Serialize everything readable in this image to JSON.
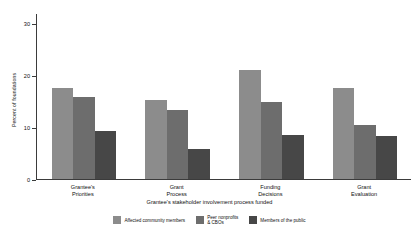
{
  "chart_data": {
    "type": "bar",
    "title": "",
    "xlabel": "Grantee's stakeholder involvement process funded",
    "ylabel": "Percent of foundations",
    "ylim": [
      0,
      32
    ],
    "yticks": [
      0,
      10,
      20,
      30
    ],
    "ytick_labels": [
      "0",
      "10",
      "20",
      "30"
    ],
    "grid": false,
    "legend_position": "bottom",
    "categories": [
      "Grantee's\nPriorities",
      "Grant\nProcess",
      "Funding\nDecisions",
      "Grant\nEvaluation"
    ],
    "series": [
      {
        "name": "Affected community members",
        "color": "#8c8c8c",
        "values": [
          17.5,
          15.2,
          21.0,
          17.5
        ]
      },
      {
        "name": "Peer nonprofits\n& CBOs",
        "color": "#6d6d6d",
        "values": [
          15.8,
          13.3,
          14.8,
          10.4
        ]
      },
      {
        "name": "Members of the public",
        "color": "#474747",
        "values": [
          9.3,
          5.7,
          8.5,
          8.3
        ]
      }
    ]
  }
}
